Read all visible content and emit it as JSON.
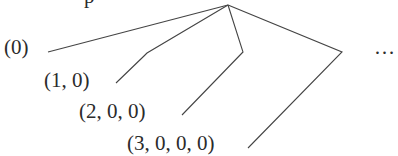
{
  "diagram": {
    "partial_top_glyph": "p",
    "apex": {
      "x": 228,
      "y": 5
    },
    "nodes": [
      {
        "label": "(0)",
        "x": 4,
        "y": 37
      },
      {
        "label": "(1, 0)",
        "x": 44,
        "y": 70
      },
      {
        "label": "(2, 0, 0)",
        "x": 79,
        "y": 101
      },
      {
        "label": "(3, 0, 0, 0)",
        "x": 127,
        "y": 133
      }
    ],
    "ellipsis": {
      "label": "…",
      "x": 374,
      "y": 37
    },
    "edges": [
      {
        "to": "(0)",
        "points": [
          [
            228,
            5
          ],
          [
            48,
            52
          ]
        ]
      },
      {
        "to": "(1, 0)",
        "points": [
          [
            228,
            5
          ],
          [
            147,
            53
          ],
          [
            144,
            56
          ],
          [
            116,
            83
          ]
        ]
      },
      {
        "to": "(2, 0, 0)",
        "points": [
          [
            228,
            5
          ],
          [
            243,
            52
          ],
          [
            182,
            115
          ]
        ]
      },
      {
        "to": "(3, 0, 0, 0)",
        "points": [
          [
            228,
            5
          ],
          [
            342,
            52
          ],
          [
            248,
            148
          ]
        ]
      }
    ],
    "stroke_color": "#444444"
  }
}
